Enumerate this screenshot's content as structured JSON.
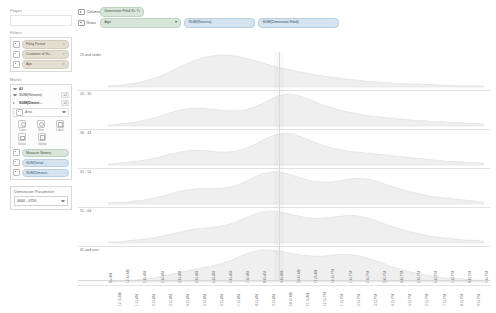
{
  "sidebar": {
    "pages": {
      "title": "Pages"
    },
    "filters": {
      "title": "Filters",
      "items": [
        {
          "label": "Filing Period",
          "type": "filter"
        },
        {
          "label": "Customer of Su..",
          "type": "filter"
        },
        {
          "label": "Age",
          "type": "filter"
        }
      ]
    },
    "marks": {
      "title": "Marks",
      "all_label": "All",
      "groups": [
        {
          "label": "SUM(Returns)",
          "badge": "a1"
        },
        {
          "label": "SUM(Dimen...",
          "badge": "a2"
        }
      ],
      "mark_type": "Area",
      "encodings": [
        {
          "name": "color",
          "label": "Color"
        },
        {
          "name": "size",
          "label": "Size"
        },
        {
          "name": "label",
          "label": "Label"
        },
        {
          "name": "detail",
          "label": "Detail"
        },
        {
          "name": "tooltip",
          "label": "Tooltip"
        }
      ],
      "measure_pills": [
        {
          "label": "Measure Names",
          "type": "dimension"
        },
        {
          "label": "SUM(Detail ..",
          "type": "measure"
        },
        {
          "label": "SUM(Dimensi..",
          "type": "measure"
        }
      ]
    },
    "parameter": {
      "title": "Dimension Parameter",
      "value": "0600 - 0759"
    }
  },
  "shelves": {
    "columns": {
      "name": "Columns",
      "pills": [
        {
          "label": "Dimension Filed Sr. Ti",
          "type": "dim",
          "caret": ""
        }
      ]
    },
    "rows": {
      "name": "Rows",
      "pills": [
        {
          "label": "Age",
          "type": "dim",
          "caret": "▾"
        },
        {
          "label": "SUM(Returns)",
          "type": "meas",
          "caret": ""
        },
        {
          "label": "SUM(Dimension Filed)",
          "type": "meas",
          "caret": ""
        }
      ]
    }
  },
  "chart_data": {
    "type": "area",
    "title": "",
    "xlabel": "",
    "ylabel": "",
    "legend_position": "none",
    "grid": false,
    "reference_line_x": "10:00 AM",
    "x": [
      "No-AM",
      "12:15 AM",
      "12:45 AM",
      "1:15 AM",
      "1:45 AM",
      "2:15 AM",
      "2:45 AM",
      "3:15 AM",
      "3:45 AM",
      "4:15 AM",
      "4:45 AM",
      "5:15 AM",
      "5:45 AM",
      "6:15 AM",
      "6:45 AM",
      "7:15 AM",
      "7:45 AM",
      "8:15 AM",
      "8:45 AM",
      "9:15 AM",
      "9:45 AM",
      "10:15 AM",
      "10:45 AM",
      "11:15 AM",
      "11:45 AM",
      "12:15 PM",
      "12:45 PM",
      "1:15 PM",
      "1:45 PM",
      "2:15 PM",
      "2:45 PM",
      "3:15 PM",
      "3:45 PM",
      "4:15 PM",
      "4:45 PM",
      "5:15 PM",
      "5:45 PM",
      "6:15 PM",
      "6:45 PM",
      "7:15 PM",
      "7:45 PM",
      "8:15 PM",
      "8:45 PM",
      "9:15 PM",
      "9:45 PM"
    ],
    "series": [
      {
        "name": "25 and under",
        "values": [
          2,
          3,
          4,
          6,
          9,
          13,
          18,
          24,
          31,
          38,
          44,
          49,
          52,
          54,
          54,
          52,
          49,
          45,
          41,
          37,
          33,
          30,
          27,
          24,
          21,
          19,
          17,
          15,
          13,
          12,
          10,
          9,
          8,
          7,
          6,
          5,
          5,
          4,
          4,
          3,
          3,
          2,
          2,
          2,
          1
        ]
      },
      {
        "name": "26 - 35",
        "values": [
          1,
          2,
          3,
          4,
          6,
          8,
          11,
          14,
          17,
          19,
          20,
          20,
          19,
          18,
          17,
          17,
          18,
          21,
          25,
          30,
          34,
          36,
          35,
          32,
          28,
          24,
          21,
          18,
          16,
          14,
          12,
          11,
          10,
          9,
          8,
          7,
          6,
          6,
          5,
          5,
          4,
          4,
          3,
          3,
          2
        ]
      },
      {
        "name": "36 - 44",
        "values": [
          1,
          2,
          3,
          4,
          5,
          7,
          9,
          12,
          14,
          16,
          17,
          17,
          16,
          15,
          15,
          16,
          19,
          23,
          28,
          33,
          36,
          37,
          35,
          31,
          27,
          23,
          20,
          18,
          16,
          15,
          14,
          13,
          12,
          11,
          10,
          9,
          8,
          7,
          6,
          5,
          4,
          4,
          3,
          3,
          2
        ]
      },
      {
        "name": "45 - 54",
        "values": [
          1,
          2,
          2,
          3,
          4,
          6,
          8,
          10,
          13,
          15,
          16,
          17,
          17,
          17,
          18,
          20,
          24,
          29,
          33,
          35,
          35,
          33,
          30,
          27,
          25,
          24,
          24,
          25,
          27,
          28,
          28,
          26,
          23,
          20,
          17,
          14,
          12,
          10,
          8,
          7,
          6,
          5,
          4,
          3,
          2
        ]
      },
      {
        "name": "55 - 64",
        "values": [
          1,
          1,
          2,
          3,
          4,
          5,
          7,
          9,
          11,
          13,
          15,
          16,
          17,
          18,
          20,
          23,
          27,
          31,
          34,
          35,
          34,
          32,
          30,
          28,
          27,
          27,
          28,
          29,
          30,
          30,
          28,
          26,
          22,
          19,
          16,
          13,
          11,
          9,
          7,
          6,
          5,
          4,
          3,
          3,
          2
        ]
      },
      {
        "name": "65 and over",
        "values": [
          1,
          1,
          2,
          2,
          3,
          4,
          6,
          8,
          10,
          12,
          14,
          16,
          18,
          20,
          23,
          27,
          31,
          34,
          36,
          36,
          35,
          33,
          31,
          30,
          29,
          29,
          30,
          31,
          31,
          30,
          28,
          25,
          22,
          18,
          15,
          12,
          10,
          8,
          7,
          5,
          4,
          4,
          3,
          2,
          2
        ]
      }
    ]
  }
}
